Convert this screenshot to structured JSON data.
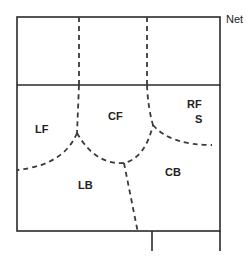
{
  "diagram": {
    "type": "volleyball-court-positions",
    "net_label": "Net",
    "zones": [
      {
        "id": "LF",
        "label": "LF",
        "x": 35,
        "y": 133
      },
      {
        "id": "CF",
        "label": "CF",
        "x": 108,
        "y": 120
      },
      {
        "id": "RF",
        "label": "RF",
        "x": 187,
        "y": 108
      },
      {
        "id": "S",
        "label": "S",
        "x": 195,
        "y": 123
      },
      {
        "id": "LB",
        "label": "LB",
        "x": 78,
        "y": 189
      },
      {
        "id": "CB",
        "label": "CB",
        "x": 165,
        "y": 176
      }
    ],
    "colors": {
      "line": "#2a2a2a",
      "background": "#ffffff"
    }
  }
}
